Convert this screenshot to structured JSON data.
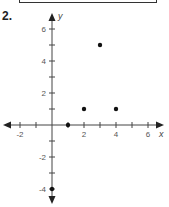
{
  "problem": {
    "number": "2."
  },
  "chart_data": {
    "type": "scatter",
    "title": "",
    "xlabel": "x",
    "ylabel": "y",
    "xlim": [
      -3,
      7
    ],
    "ylim": [
      -5,
      7
    ],
    "grid": false,
    "x_tick_labels": [
      "-2",
      "2",
      "4",
      "6"
    ],
    "y_tick_labels": [
      "6",
      "4",
      "2",
      "-2",
      "-4"
    ],
    "points": [
      {
        "x": 3,
        "y": 5
      },
      {
        "x": 2,
        "y": 1
      },
      {
        "x": 4,
        "y": 1
      },
      {
        "x": 1,
        "y": 0
      },
      {
        "x": 0,
        "y": -4
      }
    ]
  }
}
